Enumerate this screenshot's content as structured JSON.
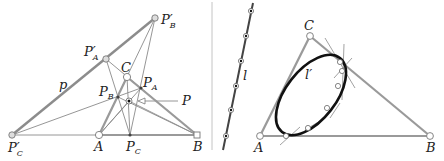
{
  "colors": {
    "thick_gray": "#9a9a9a",
    "thin_gray": "#7a7a7a",
    "dark": "#1a1a1a",
    "divider": "#bbbbbb",
    "point_fill": "#ffffff",
    "point_stroke": "#777777"
  },
  "left_panel": {
    "labels": {
      "P_B_prime": {
        "main": "P",
        "prime": "′",
        "sub": "B"
      },
      "P_A_prime": {
        "main": "P",
        "prime": "′",
        "sub": "A"
      },
      "C": "C",
      "P_A": {
        "main": "P",
        "sub": "A"
      },
      "P_B": {
        "main": "P",
        "sub": "B"
      },
      "P": "P",
      "p": "p",
      "P_C_prime": {
        "main": "P",
        "prime": "′",
        "sub": "C"
      },
      "A": "A",
      "P_C": {
        "main": "P",
        "sub": "C"
      },
      "B": "B"
    },
    "points": {
      "P_B_prime": [
        155,
        18
      ],
      "P_A_prime": [
        106,
        59
      ],
      "C": [
        127,
        77
      ],
      "P_A": [
        141,
        88
      ],
      "P_B": [
        118,
        97
      ],
      "P": [
        129,
        101
      ],
      "P_C_prime": [
        12,
        135
      ],
      "A": [
        99,
        135
      ],
      "P_C": [
        130,
        135
      ],
      "B": [
        197,
        135
      ]
    }
  },
  "right_panel": {
    "labels": {
      "l": "l",
      "l_prime": "l′",
      "C": "C",
      "A": "A",
      "B": "B"
    },
    "points": {
      "C": [
        310,
        36
      ],
      "A": [
        260,
        136
      ],
      "B": [
        430,
        136
      ]
    },
    "line_l_points": [
      [
        251,
        11
      ],
      [
        246,
        36
      ],
      [
        241,
        61
      ],
      [
        236,
        86
      ],
      [
        231,
        110
      ],
      [
        226,
        136
      ]
    ]
  }
}
